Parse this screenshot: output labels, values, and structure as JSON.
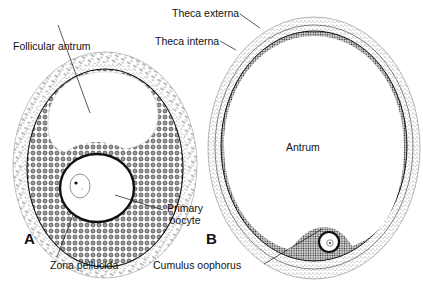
{
  "figure": {
    "panels": [
      {
        "id": "A",
        "letter": "A",
        "description": "Early antral (secondary) ovarian follicle",
        "labels": {
          "follicular_antrum": "Follicular antrum",
          "primary_oocyte_line1": "Primary",
          "primary_oocyte_line2": "oocyte",
          "zona_pellucida": "Zona pellucida"
        }
      },
      {
        "id": "B",
        "letter": "B",
        "description": "Mature (Graafian) ovarian follicle",
        "labels": {
          "theca_externa": "Theca externa",
          "theca_interna": "Theca interna",
          "antrum": "Antrum",
          "cumulus_oophorus": "Cumulus oophorus"
        }
      }
    ]
  },
  "colors": {
    "ink": "#111111",
    "background": "#ffffff",
    "stipple_light": "#8a8a8a",
    "stipple_dark": "#3a3a3a"
  }
}
